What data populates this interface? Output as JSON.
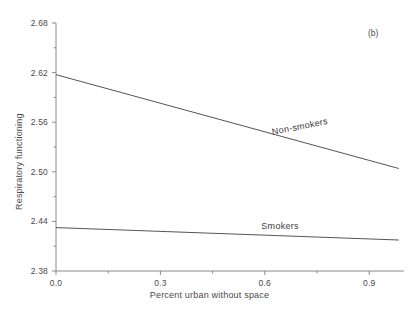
{
  "chart_data": {
    "type": "line",
    "title": "",
    "panel_label": "(b)",
    "xlabel": "Percent urban without space",
    "ylabel": "Respiratory functioning",
    "xlim": [
      0.0,
      1.0
    ],
    "ylim": [
      2.38,
      2.68
    ],
    "grid": false,
    "legend_position": "inline-on-line",
    "xticks": [
      0.0,
      0.3,
      0.6,
      0.9
    ],
    "xtick_labels": [
      "0.0",
      "0.3",
      "0.6",
      "0.9"
    ],
    "x_minor_ticks": [
      0.15,
      0.45,
      0.75
    ],
    "yticks": [
      2.38,
      2.44,
      2.5,
      2.56,
      2.62,
      2.68
    ],
    "ytick_labels": [
      "2.38",
      "2.44",
      "2.50",
      "2.56",
      "2.62",
      "2.68"
    ],
    "y_minor_ticks": [
      2.41,
      2.47,
      2.53,
      2.59,
      2.65
    ],
    "series": [
      {
        "name": "Non-smokers",
        "color": "#555555",
        "x": [
          0.0,
          0.985
        ],
        "values": [
          2.6175,
          2.504
        ],
        "label_position": {
          "x": 0.62,
          "y": 2.5485
        },
        "label_rotation": -11.3
      },
      {
        "name": "Smokers",
        "color": "#555555",
        "x": [
          0.0,
          0.985
        ],
        "values": [
          2.4325,
          2.4175
        ],
        "label_position": {
          "x": 0.59,
          "y": 2.4345
        },
        "label_rotation": 0
      }
    ]
  },
  "axis": {
    "line_color": "#8a8a8a",
    "text_color": "#4a4a4a"
  }
}
